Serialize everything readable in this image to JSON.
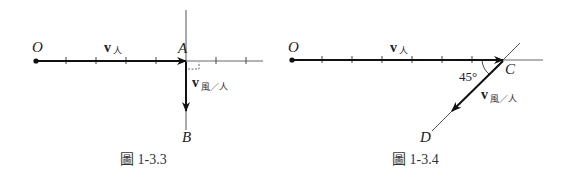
{
  "figures": [
    {
      "caption": "圖 1-3.3",
      "labels": {
        "origin": "O",
        "point_a": "A",
        "point_b": "B",
        "v_person": "v",
        "v_person_sub": "人",
        "v_wind_rel": "v",
        "v_wind_rel_sub": "風／人"
      }
    },
    {
      "caption": "圖 1-3.4",
      "labels": {
        "origin": "O",
        "point_c": "C",
        "point_d": "D",
        "angle": "45°",
        "v_person": "v",
        "v_person_sub": "人",
        "v_wind_rel": "v",
        "v_wind_rel_sub": "風／人"
      }
    }
  ],
  "colors": {
    "ink": "#111111",
    "thin_line": "#555555",
    "caption": "#333333"
  }
}
